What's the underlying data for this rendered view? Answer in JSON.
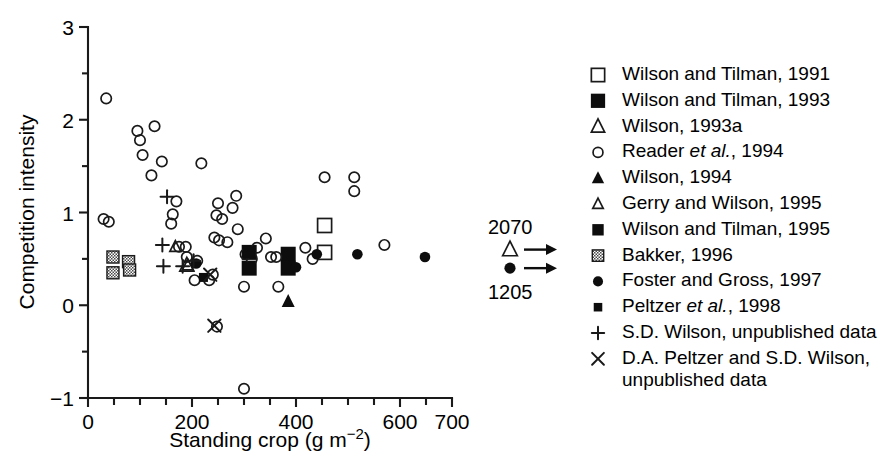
{
  "chart_data": {
    "type": "scatter",
    "title": "",
    "xlabel": "Standing crop (g m−2)",
    "ylabel": "Competition intensity",
    "xlim": [
      0,
      700
    ],
    "ylim": [
      -1,
      3
    ],
    "x_major_ticks": [
      0,
      200,
      400,
      600,
      700
    ],
    "x_major_tick_labels": [
      "0",
      "200",
      "400",
      "600",
      "700"
    ],
    "x_minor_ticks": [
      50,
      100,
      150,
      250,
      300,
      350,
      450,
      500,
      550,
      650
    ],
    "y_major_ticks": [
      -1,
      0,
      1,
      2,
      3
    ],
    "y_major_tick_labels": [
      "−1",
      "0",
      "1",
      "2",
      "3"
    ],
    "y_minor_ticks": [
      -0.5,
      0.5,
      1.5,
      2.5
    ],
    "grid": false,
    "legend_position": "right",
    "series": [
      {
        "name": "Wilson and Tilman, 1991",
        "marker": "open-square",
        "points": [
          [
            455,
            0.86
          ],
          [
            455,
            0.57
          ]
        ]
      },
      {
        "name": "Wilson and Tilman, 1993",
        "marker": "filled-square-large",
        "points": [
          [
            310,
            0.57
          ],
          [
            310,
            0.4
          ],
          [
            385,
            0.55
          ],
          [
            385,
            0.4
          ]
        ]
      },
      {
        "name": "Wilson, 1993a",
        "marker": "open-triangle-large",
        "points": [
          [
            190,
            0.43
          ]
        ]
      },
      {
        "name": "Reader et al., 1994",
        "marker": "open-circle",
        "points": [
          [
            35,
            2.23
          ],
          [
            95,
            1.88
          ],
          [
            100,
            1.78
          ],
          [
            128,
            1.93
          ],
          [
            105,
            1.62
          ],
          [
            142,
            1.55
          ],
          [
            122,
            1.4
          ],
          [
            218,
            1.53
          ],
          [
            30,
            0.93
          ],
          [
            40,
            0.9
          ],
          [
            170,
            1.12
          ],
          [
            163,
            0.98
          ],
          [
            160,
            0.88
          ],
          [
            175,
            0.63
          ],
          [
            188,
            0.63
          ],
          [
            190,
            0.52
          ],
          [
            210,
            0.48
          ],
          [
            205,
            0.27
          ],
          [
            250,
            1.1
          ],
          [
            247,
            0.97
          ],
          [
            258,
            0.93
          ],
          [
            243,
            0.73
          ],
          [
            252,
            0.7
          ],
          [
            268,
            0.68
          ],
          [
            278,
            1.05
          ],
          [
            285,
            1.18
          ],
          [
            288,
            0.82
          ],
          [
            303,
            0.55
          ],
          [
            315,
            0.5
          ],
          [
            325,
            0.62
          ],
          [
            342,
            0.72
          ],
          [
            300,
            0.2
          ],
          [
            300,
            -0.9
          ],
          [
            233,
            0.27
          ],
          [
            240,
            0.33
          ],
          [
            248,
            -0.23
          ],
          [
            352,
            0.52
          ],
          [
            362,
            0.52
          ],
          [
            366,
            0.2
          ],
          [
            418,
            0.62
          ],
          [
            432,
            0.5
          ],
          [
            455,
            1.38
          ],
          [
            512,
            1.38
          ],
          [
            512,
            1.23
          ],
          [
            570,
            0.65
          ]
        ]
      },
      {
        "name": "Wilson, 1994",
        "marker": "filled-triangle",
        "points": [
          [
            385,
            0.04
          ]
        ]
      },
      {
        "name": "Gerry and Wilson, 1995",
        "marker": "open-triangle-small",
        "points": [
          [
            168,
            0.63
          ],
          [
            192,
            0.43
          ]
        ]
      },
      {
        "name": "Wilson and Tilman, 1995",
        "marker": "filled-square-med",
        "points": [
          [
            310,
            0.57
          ],
          [
            310,
            0.4
          ]
        ]
      },
      {
        "name": "Bakker, 1996",
        "marker": "hatched-square",
        "points": [
          [
            48,
            0.52
          ],
          [
            48,
            0.35
          ],
          [
            78,
            0.47
          ],
          [
            80,
            0.38
          ]
        ]
      },
      {
        "name": "Foster and Gross, 1997",
        "marker": "filled-circle",
        "points": [
          [
            208,
            0.45
          ],
          [
            400,
            0.41
          ],
          [
            440,
            0.55
          ],
          [
            518,
            0.55
          ],
          [
            648,
            0.52
          ]
        ]
      },
      {
        "name": "Peltzer et al., 1998",
        "marker": "filled-square-small",
        "points": [
          [
            222,
            0.3
          ]
        ]
      },
      {
        "name": "S.D. Wilson, unpublished data",
        "marker": "plus",
        "points": [
          [
            152,
            1.17
          ],
          [
            143,
            0.65
          ],
          [
            145,
            0.42
          ],
          [
            182,
            0.42
          ],
          [
            203,
            0.48
          ]
        ]
      },
      {
        "name": "D.A. Peltzer and S.D. Wilson, unpublished data",
        "marker": "cross",
        "points": [
          [
            235,
            0.33
          ],
          [
            243,
            -0.22
          ]
        ]
      }
    ],
    "annotations": [
      {
        "label": "2070",
        "marker": "open-triangle-large",
        "arrow": "right",
        "y": 0.6
      },
      {
        "label": "1205",
        "marker": "filled-circle",
        "arrow": "right",
        "y": 0.4
      }
    ]
  },
  "legend": {
    "items": [
      {
        "marker": "open-square",
        "label": "Wilson and Tilman, 1991"
      },
      {
        "marker": "filled-square-large",
        "label": "Wilson and Tilman, 1993"
      },
      {
        "marker": "open-triangle-large",
        "label": "Wilson, 1993a"
      },
      {
        "marker": "open-circle",
        "label_pre": "Reader ",
        "label_ital": "et al.",
        "label_post": ", 1994"
      },
      {
        "marker": "filled-triangle",
        "label": "Wilson, 1994"
      },
      {
        "marker": "open-triangle-small",
        "label": "Gerry and Wilson, 1995"
      },
      {
        "marker": "filled-square-med",
        "label": "Wilson and Tilman, 1995"
      },
      {
        "marker": "hatched-square",
        "label": "Bakker, 1996"
      },
      {
        "marker": "filled-circle",
        "label": "Foster and Gross, 1997"
      },
      {
        "marker": "filled-square-small",
        "label_pre": "Peltzer ",
        "label_ital": "et al.",
        "label_post": ", 1998"
      },
      {
        "marker": "plus",
        "label": "S.D. Wilson, unpublished data"
      },
      {
        "marker": "cross",
        "label": "D.A. Peltzer and S.D. Wilson,",
        "label2": "unpublished data"
      }
    ]
  },
  "axes": {
    "y_label": "Competition intensity",
    "x_label_main": "Standing crop (g m",
    "x_label_sup": "−2",
    "x_label_end": ")"
  },
  "colors": {
    "ink": "#1a1a1a",
    "marker_fill": "#0d0d0d",
    "background": "#ffffff"
  }
}
